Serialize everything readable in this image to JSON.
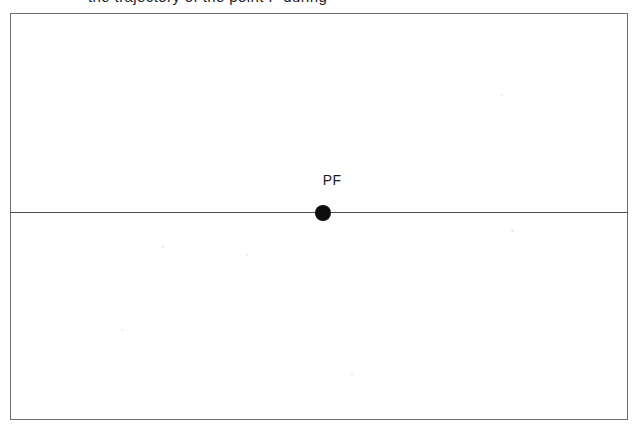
{
  "page": {
    "width": 644,
    "height": 438,
    "background_color": "#ffffff"
  },
  "caption": {
    "text": "the trajectory of the point P during",
    "note": "cropped at top edge of scan; only descenders visible"
  },
  "figure": {
    "frame": {
      "border_color": "#6f6f72",
      "fill_color": "#ffffff",
      "left": 10,
      "top": 13,
      "width": 618,
      "height": 407
    },
    "divider": {
      "color": "#4e4e52",
      "y": 212,
      "orientation": "horizontal"
    },
    "marker": {
      "label": "PF",
      "dot_color": "#0d0d0d",
      "dot_radius": 8,
      "center_x": 323,
      "center_y": 213
    }
  }
}
